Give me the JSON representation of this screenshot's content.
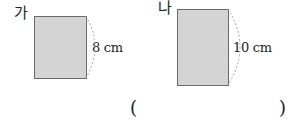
{
  "figures": [
    {
      "label": "가",
      "dimension": "8 cm",
      "dimension_value": 8,
      "unit": "cm"
    },
    {
      "label": "나",
      "dimension": "10 cm",
      "dimension_value": 10,
      "unit": "cm"
    }
  ],
  "answer": {
    "open": "(",
    "close": ")",
    "value": ""
  },
  "colors": {
    "fill": "#d4d4d4",
    "stroke": "#6a6a6a",
    "arc": "#999999"
  }
}
